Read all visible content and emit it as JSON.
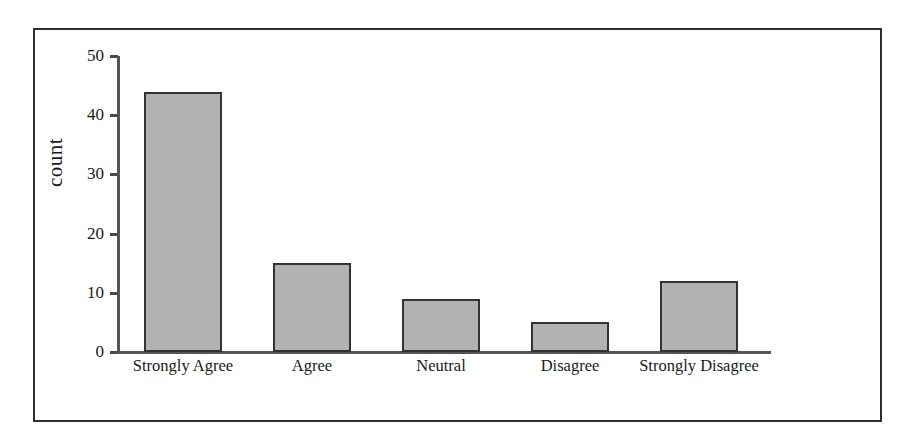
{
  "chart_data": {
    "type": "bar",
    "title": "",
    "xlabel": "",
    "ylabel": "count",
    "categories": [
      "Strongly Agree",
      "Agree",
      "Neutral",
      "Disagree",
      "Strongly Disagree"
    ],
    "values": [
      44,
      15,
      9,
      5,
      12
    ],
    "ylim": [
      0,
      50
    ],
    "yticks": [
      0,
      10,
      20,
      30,
      40,
      50
    ],
    "ytick_labels": [
      "0",
      "10",
      "20",
      "30",
      "40",
      "50"
    ],
    "grid": false,
    "legend": false,
    "bar_fill_color": "#b2b2b2",
    "bar_edge_color": "#333333",
    "axis_color": "#555555",
    "frame_color": "#2e2e2e",
    "text_color": "#1a1a1a"
  },
  "axis": {
    "y_title": "count"
  }
}
